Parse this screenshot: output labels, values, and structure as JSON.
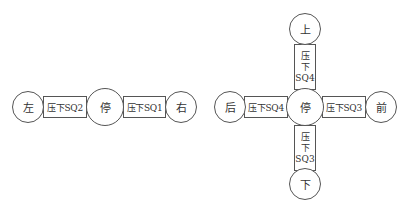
{
  "left_diagram": {
    "left_state": "左",
    "center_state": "停",
    "right_state": "右",
    "left_condition": "压下SQ2",
    "right_condition": "压下SQ1"
  },
  "right_diagram": {
    "left_state": "后",
    "center_state": "停",
    "right_state": "前",
    "top_state": "上",
    "bottom_state": "下",
    "left_condition": "压下SQ4",
    "right_condition": "压下SQ3",
    "top_condition": {
      "line1": "压",
      "line2": "下",
      "line3": "SQ4"
    },
    "bottom_condition": {
      "line1": "压",
      "line2": "下",
      "line3": "SQ3"
    }
  }
}
